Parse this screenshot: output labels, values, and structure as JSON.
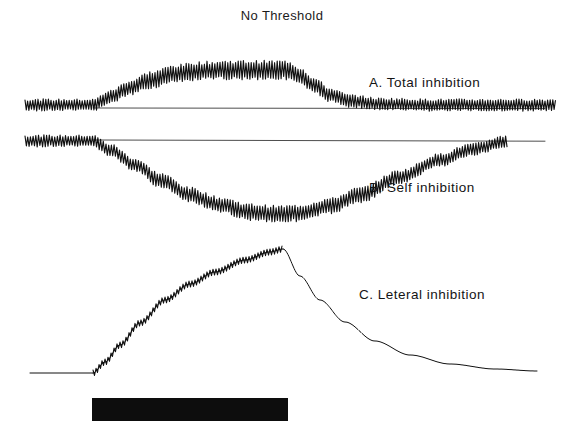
{
  "figure": {
    "title": "No Threshold",
    "background_color": "#ffffff",
    "ink_color": "#111111",
    "width": 564,
    "height": 432
  },
  "traces": [
    {
      "id": "A",
      "label": "A. Total inhibition",
      "label_x": 369,
      "label_y": 75,
      "baseline_y": 105,
      "plateau_y": 70,
      "noise": "oscillatory",
      "baseline_amplitude": 5,
      "plateau_amplitude": 8,
      "onset_x": 93,
      "offset_x": 288,
      "reference_line_y": 108,
      "reference_line_x0": 93,
      "reference_line_x1": 545,
      "x_start": 25,
      "x_end": 556,
      "description": "Rises from baseline to an elevated oscillating plateau during the stimulus, then returns to baseline."
    },
    {
      "id": "B",
      "label": "B. Self inhibition",
      "label_x": 369,
      "label_y": 180,
      "baseline_y": 141,
      "trough_y": 214,
      "noise": "oscillatory",
      "baseline_amplitude": 5,
      "trough_amplitude": 7,
      "onset_x": 93,
      "trough_x": 278,
      "reference_line_y": 140,
      "reference_line_x0": 93,
      "reference_line_x1": 545,
      "x_start": 25,
      "x_end": 508,
      "description": "Falls below baseline during the stimulus reaching a trough, then recovers back toward and slightly above baseline."
    },
    {
      "id": "C",
      "label": "C. Leteral inhibition",
      "label_x": 359,
      "label_y": 287,
      "baseline_y": 373,
      "peak_y": 249,
      "noise": "staircase",
      "rise_amplitude": 3,
      "onset_x": 93,
      "peak_x": 283,
      "x_start": 30,
      "x_end": 537,
      "description": "Flat baseline, then a smooth staircase rise to a peak at stimulus offset, followed by a clean exponential decay back to baseline."
    }
  ],
  "stimulus_bar": {
    "name": "stimulus-bar",
    "x": 92,
    "y": 398,
    "width": 196,
    "height": 23,
    "color": "#0d0d0d"
  },
  "chart_data": {
    "type": "line",
    "title": "No Threshold",
    "xlabel": "",
    "ylabel": "",
    "grid": false,
    "legend": "inline-right",
    "xlim": [
      0,
      564
    ],
    "stimulus_onset_x": 93,
    "stimulus_offset_x": 288,
    "series": [
      {
        "name": "A. Total inhibition",
        "x": [
          25,
          60,
          93,
          110,
          130,
          150,
          175,
          200,
          230,
          260,
          288,
          300,
          315,
          330,
          350,
          380,
          430,
          500,
          556
        ],
        "values": [
          105,
          105,
          105,
          97,
          88,
          80,
          74,
          71,
          70,
          70,
          70,
          76,
          86,
          95,
          101,
          104,
          105,
          105,
          105
        ],
        "note": "y in pixel space, smaller y = larger response"
      },
      {
        "name": "B. Self inhibition",
        "x": [
          25,
          60,
          93,
          110,
          135,
          160,
          190,
          220,
          250,
          278,
          300,
          330,
          360,
          400,
          440,
          470,
          508
        ],
        "values": [
          141,
          141,
          141,
          150,
          165,
          180,
          195,
          205,
          212,
          214,
          213,
          206,
          195,
          177,
          160,
          150,
          141
        ]
      },
      {
        "name": "C. Leteral inhibition",
        "x": [
          30,
          60,
          93,
          105,
          120,
          140,
          165,
          190,
          215,
          245,
          270,
          283,
          300,
          320,
          345,
          375,
          410,
          450,
          495,
          537
        ],
        "values": [
          373,
          373,
          373,
          362,
          345,
          323,
          300,
          284,
          272,
          260,
          252,
          249,
          276,
          300,
          322,
          341,
          355,
          364,
          369,
          371
        ]
      }
    ]
  }
}
